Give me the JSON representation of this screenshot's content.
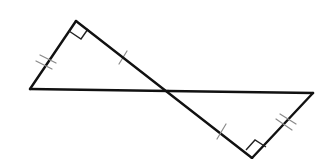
{
  "diagram": {
    "colors": {
      "edge": "#111111",
      "tick": "#8a8a8a",
      "background": "#ffffff"
    },
    "triangles": [
      {
        "id": "left-triangle",
        "vertices": {
          "top": [
            76,
            21
          ],
          "bottom_left": [
            30,
            89
          ],
          "crossing": [
            168,
            91
          ]
        },
        "right_angle_at": "top",
        "tick_marks": {
          "short_leg": 2,
          "long_leg": 1
        }
      },
      {
        "id": "right-triangle",
        "vertices": {
          "crossing": [
            168,
            91
          ],
          "right": [
            313,
            93
          ],
          "bottom": [
            252,
            158
          ]
        },
        "right_angle_at": "bottom",
        "tick_marks": {
          "short_leg": 2,
          "long_leg": 1
        }
      }
    ],
    "labels": []
  }
}
